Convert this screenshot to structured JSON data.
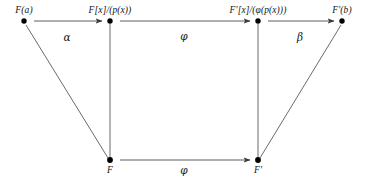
{
  "diagram": {
    "kind": "commutative-diagram",
    "background_color": "#ffffff",
    "line_color": "#4a4a4a",
    "node_color": "#000000",
    "text_color": "#141414",
    "nodes": [
      {
        "id": "Fa",
        "label": "F(a)",
        "x": 24,
        "y": 21,
        "label_x": 24,
        "label_y": 5,
        "label_anchor": "center"
      },
      {
        "id": "FxP",
        "label": "F[x]/(p(x))",
        "x": 110,
        "y": 21,
        "label_x": 110,
        "label_y": 5,
        "label_anchor": "center"
      },
      {
        "id": "FpxPhi",
        "label": "F'[x]/(φ(p(x)))",
        "x": 258,
        "y": 21,
        "label_x": 258,
        "label_y": 5,
        "label_anchor": "center"
      },
      {
        "id": "Fpb",
        "label": "F'(b)",
        "x": 342,
        "y": 21,
        "label_x": 342,
        "label_y": 5,
        "label_anchor": "center"
      },
      {
        "id": "F",
        "label": "F",
        "x": 110,
        "y": 160,
        "label_x": 110,
        "label_y": 166,
        "label_anchor": "center"
      },
      {
        "id": "Fp",
        "label": "F'",
        "x": 258,
        "y": 160,
        "label_x": 258,
        "label_y": 166,
        "label_anchor": "center"
      }
    ],
    "edges": [
      {
        "id": "alpha",
        "from": "Fa",
        "to": "FxP",
        "arrow": true,
        "label": "α",
        "label_x": 67,
        "label_y": 32
      },
      {
        "id": "phi-top",
        "from": "FxP",
        "to": "FpxPhi",
        "arrow": true,
        "label": "φ",
        "label_x": 184,
        "label_y": 31
      },
      {
        "id": "beta",
        "from": "FpxPhi",
        "to": "Fpb",
        "arrow": true,
        "label": "β",
        "label_x": 300,
        "label_y": 32
      },
      {
        "id": "phi-bottom",
        "from": "F",
        "to": "Fp",
        "arrow": true,
        "label": "φ",
        "label_x": 184,
        "label_y": 165
      },
      {
        "id": "left-vert",
        "from": "FxP",
        "to": "F",
        "arrow": false,
        "label": "",
        "label_x": 0,
        "label_y": 0
      },
      {
        "id": "right-vert",
        "from": "FpxPhi",
        "to": "Fp",
        "arrow": false,
        "label": "",
        "label_x": 0,
        "label_y": 0
      },
      {
        "id": "left-diag",
        "from": "Fa",
        "to": "F",
        "arrow": false,
        "label": "",
        "label_x": 0,
        "label_y": 0
      },
      {
        "id": "right-diag",
        "from": "Fp",
        "to": "Fpb",
        "arrow": false,
        "label": "",
        "label_x": 0,
        "label_y": 0
      }
    ]
  }
}
